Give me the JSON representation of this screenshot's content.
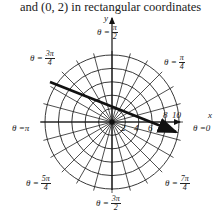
{
  "caption": "and (0, 2) in rectangular coordinates",
  "axes": {
    "x_label": "x",
    "y_label": "y"
  },
  "radial_ticks": [
    "2",
    "4",
    "6",
    "8",
    "10"
  ],
  "angle_labels": {
    "theta_0": {
      "prefix": "θ = ",
      "value": "0"
    },
    "theta_pi4": {
      "prefix": "θ = ",
      "num": "π",
      "den": "4"
    },
    "theta_pi2": {
      "prefix": "θ = ",
      "num": "π",
      "den": "2"
    },
    "theta_3pi4": {
      "prefix": "θ = ",
      "num": "3π",
      "den": "4"
    },
    "theta_pi": {
      "prefix": "θ = ",
      "value": "π"
    },
    "theta_5pi4": {
      "prefix": "θ = ",
      "num": "5π",
      "den": "4"
    },
    "theta_3pi2": {
      "prefix": "θ = ",
      "num": "3π",
      "den": "2"
    },
    "theta_7pi4": {
      "prefix": "θ = ",
      "num": "7π",
      "den": "4"
    }
  },
  "grid": {
    "type": "polar",
    "radii": [
      2,
      4,
      6,
      8,
      10
    ],
    "spoke_step": "π/12",
    "colors": {
      "line": "#222222",
      "arrow": "#111111"
    }
  },
  "highlight_arrow": {
    "description": "thick arrow through the pole, from the θ=3π/4 side toward lower-right"
  }
}
